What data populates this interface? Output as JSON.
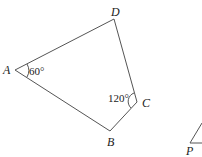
{
  "figure": {
    "quadrilateral": {
      "vertices": {
        "A": {
          "label": "A",
          "x": 15,
          "y": 70
        },
        "B": {
          "label": "B",
          "x": 110,
          "y": 131
        },
        "C": {
          "label": "C",
          "x": 137,
          "y": 102
        },
        "D": {
          "label": "D",
          "x": 114,
          "y": 19
        }
      },
      "angles": {
        "A": {
          "label": "60°"
        },
        "C": {
          "label": "120°"
        }
      }
    },
    "partial_figure": {
      "vertex_label": "P"
    },
    "stroke_color": "#555555"
  }
}
